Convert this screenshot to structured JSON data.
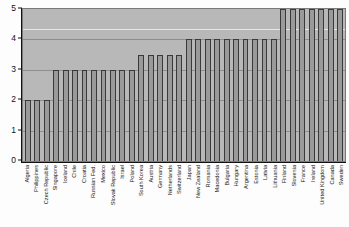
{
  "chart_data": {
    "type": "bar",
    "title": "",
    "subtitle": "",
    "xlabel": "",
    "ylabel": "",
    "ylim": [
      0,
      5
    ],
    "yticks": [
      "0",
      "1",
      "2",
      "3",
      "4",
      "5"
    ],
    "grid": true,
    "legend": null,
    "categories": [
      "Algeria",
      "Philippines",
      "Czech Republic",
      "Singapore",
      "Iceland",
      "Chile",
      "Croatia",
      "Russian Fed.",
      "Mexico",
      "Slovak Republic",
      "Israel",
      "Poland",
      "South Korea",
      "Austria",
      "Germany",
      "Netherlands",
      "Switzerland",
      "Japan",
      "New Zealand",
      "Romania",
      "Macedonia",
      "Bulgaria",
      "Hungary",
      "Argentina",
      "Estonia",
      "Latvia",
      "Lithuania",
      "Finland",
      "Slovenia",
      "France",
      "Ireland",
      "United Kingdom",
      "Canada",
      "Sweden"
    ],
    "values": [
      2,
      2,
      2,
      3,
      3,
      3,
      3,
      3,
      3,
      3,
      3,
      3,
      3.5,
      3.5,
      3.5,
      3.5,
      3.5,
      4,
      4,
      4,
      4,
      4,
      4,
      4,
      4,
      4,
      4,
      5,
      5,
      5,
      5,
      5,
      5,
      5
    ],
    "bar_color": "#9a9a9a",
    "bar_edge_color": "#3a3a3a",
    "plot_bg_color": "#b8b8b8"
  }
}
